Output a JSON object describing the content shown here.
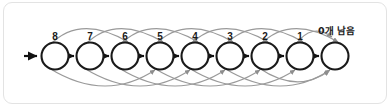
{
  "figure": {
    "type": "state-transition-chain",
    "frame": {
      "border_color": "#e3e3e3",
      "background": "#ffffff",
      "radius_px": 9
    },
    "colors": {
      "node_stroke": "#1a1a1a",
      "node_fill": "#ffffff",
      "straight_arrow": "#111111",
      "arc_stroke": "#9a9a9a",
      "label_text": "#1a1a1a"
    },
    "geometry": {
      "first_node_cx": 55,
      "node_spacing": 35,
      "node_cy": 56,
      "node_radius": 13.5,
      "node_count": 9,
      "entry_arrow_x1": 24,
      "entry_arrow_x2": 39
    },
    "nodes": [
      {
        "id": "n8",
        "label": "8",
        "cx": 55,
        "has_label": true
      },
      {
        "id": "n7",
        "label": "7",
        "cx": 90,
        "has_label": true
      },
      {
        "id": "n6",
        "label": "6",
        "cx": 125,
        "has_label": true
      },
      {
        "id": "n5",
        "label": "5",
        "cx": 160,
        "has_label": true
      },
      {
        "id": "n4",
        "label": "4",
        "cx": 195,
        "has_label": true
      },
      {
        "id": "n3",
        "label": "3",
        "cx": 230,
        "has_label": true
      },
      {
        "id": "n2",
        "label": "2",
        "cx": 265,
        "has_label": true
      },
      {
        "id": "n1",
        "label": "1",
        "cx": 300,
        "has_label": true
      },
      {
        "id": "n0",
        "label": "",
        "cx": 335,
        "has_label": false
      }
    ],
    "tail_label": {
      "text": "0개 남음",
      "x": 318,
      "y": 34
    },
    "entry_arrow": {
      "name": "entry-arrow",
      "direction": "right"
    },
    "straight_arrows": [
      {
        "from": "n8",
        "to": "n7"
      },
      {
        "from": "n7",
        "to": "n6"
      },
      {
        "from": "n6",
        "to": "n5"
      },
      {
        "from": "n5",
        "to": "n4"
      },
      {
        "from": "n4",
        "to": "n3"
      },
      {
        "from": "n3",
        "to": "n2"
      },
      {
        "from": "n2",
        "to": "n1"
      },
      {
        "from": "n1",
        "to": "n0"
      }
    ],
    "upper_arcs": [
      {
        "from": "n8",
        "to": "n6",
        "span": 2
      },
      {
        "from": "n7",
        "to": "n5",
        "span": 2
      },
      {
        "from": "n6",
        "to": "n4",
        "span": 2
      },
      {
        "from": "n5",
        "to": "n3",
        "span": 2
      },
      {
        "from": "n4",
        "to": "n2",
        "span": 2
      },
      {
        "from": "n3",
        "to": "n1",
        "span": 2
      },
      {
        "from": "n2",
        "to": "n0",
        "span": 2
      },
      {
        "from": "n1",
        "to": "n0",
        "span": 1
      }
    ],
    "lower_arcs": [
      {
        "from": "n8",
        "to": "n5",
        "span": 3
      },
      {
        "from": "n7",
        "to": "n4",
        "span": 3
      },
      {
        "from": "n6",
        "to": "n3",
        "span": 3
      },
      {
        "from": "n5",
        "to": "n2",
        "span": 3
      },
      {
        "from": "n4",
        "to": "n1",
        "span": 3
      },
      {
        "from": "n3",
        "to": "n0",
        "span": 3
      },
      {
        "from": "n2",
        "to": "n0",
        "span": 2
      }
    ]
  }
}
